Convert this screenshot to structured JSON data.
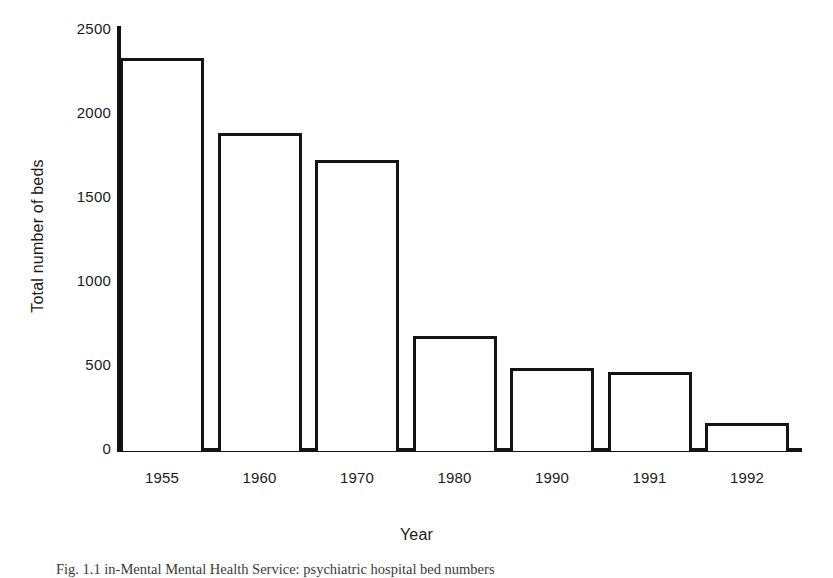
{
  "figure": {
    "caption": "Fig. 1.1   in-Mental Mental Health Service: psychiatric hospital bed numbers"
  },
  "chart_data": {
    "type": "bar",
    "title": "",
    "xlabel": "Year",
    "ylabel": "Total number of beds",
    "categories": [
      "1955",
      "1960",
      "1970",
      "1980",
      "1990",
      "1991",
      "1992"
    ],
    "values": [
      2330,
      1880,
      1720,
      670,
      480,
      460,
      155
    ],
    "ylim": [
      0,
      2500
    ],
    "yticks": [
      0,
      500,
      1000,
      1500,
      2000,
      2500
    ],
    "yticklabels": [
      "0",
      "500",
      "1000",
      "1500",
      "2000",
      "2500"
    ],
    "grid": false,
    "legend": false,
    "bar_style": {
      "fill": "#ffffff",
      "edge": "#141414",
      "edge_width": 3
    },
    "axis_color": "#141414"
  }
}
